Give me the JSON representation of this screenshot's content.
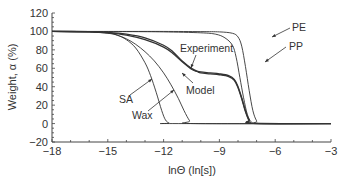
{
  "chart_data": {
    "type": "line",
    "title": "",
    "xlabel": "lnΘ (ln[s])",
    "ylabel": "Weight, α (%)",
    "xlim": [
      -18,
      -3
    ],
    "ylim": [
      -20,
      120
    ],
    "xticks": [
      -18,
      -15,
      -12,
      -9,
      -6,
      -3
    ],
    "yticks": [
      -20,
      0,
      20,
      40,
      60,
      80,
      100,
      120
    ],
    "xtick_labels": [
      "−18",
      "−15",
      "−12",
      "−9",
      "−6",
      "−3"
    ],
    "ytick_labels": [
      "−20",
      "0",
      "20",
      "40",
      "60",
      "80",
      "100",
      "120"
    ],
    "grid": false,
    "legend": "none",
    "series": [
      {
        "name": "SA",
        "x": [
          -18,
          -16,
          -15,
          -14.5,
          -14,
          -13.5,
          -13,
          -12.7,
          -12.4,
          -12.1,
          -11.9,
          -11.7,
          -11.5,
          -3
        ],
        "y": [
          100,
          99.5,
          98.5,
          96,
          91,
          82,
          66,
          52,
          34,
          14,
          4,
          0.5,
          0,
          0
        ]
      },
      {
        "name": "Wax",
        "x": [
          -18,
          -16,
          -15,
          -14.5,
          -14,
          -13.5,
          -13,
          -12.5,
          -12,
          -11.6,
          -11.2,
          -10.9,
          -10.6,
          -10.4,
          -3
        ],
        "y": [
          100,
          99.5,
          98,
          96,
          92,
          86,
          78,
          68,
          55,
          42,
          27,
          14,
          3,
          0,
          0
        ]
      },
      {
        "name": "Experiment",
        "x": [
          -18,
          -16,
          -15,
          -14,
          -13,
          -12,
          -11.5,
          -11,
          -10.5,
          -10.2,
          -10,
          -9.5,
          -9,
          -8.5,
          -8.2,
          -8,
          -7.8,
          -7.6,
          -7.4,
          -7.2,
          -3
        ],
        "y": [
          100,
          99.8,
          99,
          97,
          93,
          85,
          78,
          68,
          60,
          57,
          56,
          55,
          54,
          52,
          48,
          40,
          28,
          14,
          4,
          0.5,
          0
        ]
      },
      {
        "name": "Model",
        "x": [
          -18,
          -16,
          -15,
          -14,
          -13,
          -12,
          -11.5,
          -11,
          -10.5,
          -10.2,
          -10,
          -9.5,
          -9,
          -8.5,
          -8.2,
          -8,
          -7.8,
          -7.6,
          -7.4,
          -7.2,
          -3
        ],
        "y": [
          100,
          99.6,
          98.5,
          96,
          91,
          83,
          76,
          67,
          59,
          56.5,
          55,
          54,
          53,
          51,
          47,
          39,
          27,
          13,
          3,
          0.3,
          0
        ]
      },
      {
        "name": "PP",
        "x": [
          -18,
          -14,
          -12,
          -10,
          -9.2,
          -8.7,
          -8.3,
          -8.1,
          -7.9,
          -7.7,
          -7.5,
          -7.3,
          -7.1,
          -3
        ],
        "y": [
          100,
          99.8,
          99.5,
          98.5,
          97,
          93,
          85,
          72,
          50,
          28,
          10,
          2,
          0,
          0
        ]
      },
      {
        "name": "PE",
        "x": [
          -18,
          -14,
          -12,
          -10,
          -9,
          -8.3,
          -8,
          -7.8,
          -7.6,
          -7.4,
          -7.2,
          -7.0,
          -6.8,
          -3
        ],
        "y": [
          100,
          100,
          100,
          99.8,
          99.5,
          98,
          94,
          84,
          62,
          36,
          14,
          3,
          0,
          0
        ]
      }
    ],
    "annotations": [
      {
        "text": "PE",
        "target_series": "PE"
      },
      {
        "text": "PP",
        "target_series": "PP"
      },
      {
        "text": "Experiment",
        "target_series": "Experiment"
      },
      {
        "text": "Model",
        "target_series": "Model"
      },
      {
        "text": "SA",
        "target_series": "SA"
      },
      {
        "text": "Wax",
        "target_series": "Wax"
      }
    ]
  }
}
